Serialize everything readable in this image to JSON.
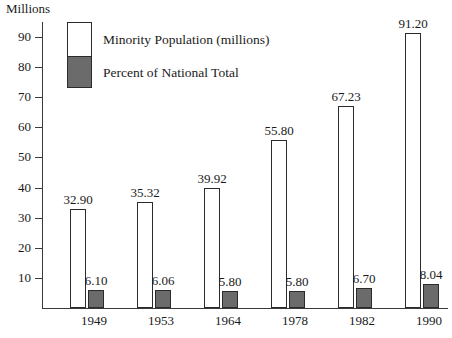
{
  "chart_data": {
    "type": "bar",
    "title": "",
    "ylabel": "Millions",
    "xlabel": "",
    "categories": [
      "1949",
      "1953",
      "1964",
      "1978",
      "1982",
      "1990"
    ],
    "series": [
      {
        "name": "Minority Population (millions)",
        "color": "#ffffff",
        "values": [
          32.9,
          35.32,
          39.92,
          55.8,
          67.23,
          91.2
        ],
        "labels": [
          "32.90",
          "35.32",
          "39.92",
          "55.80",
          "67.23",
          "91.20"
        ]
      },
      {
        "name": "Percent of National Total",
        "color": "#6b6b6b",
        "values": [
          6.1,
          6.06,
          5.8,
          5.8,
          6.7,
          8.04
        ],
        "labels": [
          "6.10",
          "6.06",
          "5.80",
          "5.80",
          "6.70",
          "8.04"
        ]
      }
    ],
    "ylim": [
      0,
      93
    ],
    "yticks": [
      10,
      20,
      30,
      40,
      50,
      60,
      70,
      80,
      90
    ],
    "ytick_labels": [
      "10",
      "20",
      "30",
      "40",
      "50",
      "60",
      "70",
      "80",
      "90"
    ],
    "grid": false,
    "legend_position": "top-left"
  },
  "axis": {
    "y_title": "Millions"
  },
  "legend": {
    "entry_population": "Minority Population (millions)",
    "entry_percent": "Percent of National Total"
  }
}
